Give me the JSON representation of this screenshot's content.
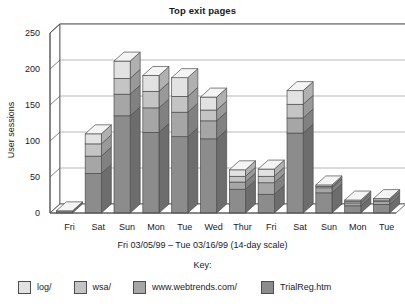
{
  "chart_data": {
    "type": "bar",
    "subtype": "stacked-3d-column",
    "title": "Top exit pages",
    "xlabel": "Fri 03/05/99 – Tue 03/16/99 (14-day scale)",
    "ylabel": "User sessions",
    "categories": [
      "Fri",
      "Sat",
      "Sun",
      "Mon",
      "Tue",
      "Wed",
      "Thur",
      "Fri",
      "Sat",
      "Sun",
      "Mon",
      "Tue"
    ],
    "ylim": [
      0,
      250
    ],
    "yticks": [
      0,
      50,
      100,
      150,
      200,
      250
    ],
    "grid": true,
    "legend_position": "bottom",
    "legend_title": "Key:",
    "series": [
      {
        "name": "TrialReg.htm",
        "color": "#8c8c8c",
        "values": [
          3,
          55,
          135,
          112,
          106,
          103,
          33,
          26,
          111,
          28,
          10,
          12
        ]
      },
      {
        "name": "www.webtrends.com/",
        "color": "#a6a6a6",
        "values": [
          0,
          24,
          30,
          34,
          34,
          25,
          10,
          16,
          21,
          7,
          4,
          4
        ]
      },
      {
        "name": "wsa/",
        "color": "#c4c4c4",
        "values": [
          0,
          17,
          22,
          23,
          22,
          15,
          8,
          9,
          19,
          2,
          2,
          2
        ]
      },
      {
        "name": "log/",
        "color": "#e2e2e2",
        "values": [
          0,
          14,
          24,
          22,
          26,
          18,
          9,
          10,
          19,
          2,
          2,
          2
        ]
      }
    ],
    "totals": [
      3,
      110,
      211,
      191,
      188,
      161,
      60,
      61,
      170,
      39,
      18,
      20
    ]
  },
  "legend": {
    "title": "Key:",
    "items": [
      {
        "label": "log/",
        "color": "#e2e2e2"
      },
      {
        "label": "wsa/",
        "color": "#c4c4c4"
      },
      {
        "label": "www.webtrends.com/",
        "color": "#a6a6a6"
      },
      {
        "label": "TrialReg.htm",
        "color": "#8c8c8c"
      }
    ]
  },
  "axes": {
    "y_title": "User sessions",
    "y_tick_labels": [
      "250",
      "200",
      "150",
      "100",
      "50",
      "0"
    ],
    "x_tick_labels": [
      "Fri",
      "Sat",
      "Sun",
      "Mon",
      "Tue",
      "Wed",
      "Thur",
      "Fri",
      "Sat",
      "Sun",
      "Mon",
      "Tue"
    ],
    "x_title": "Fri 03/05/99 – Tue 03/16/99 (14-day scale)"
  },
  "style": {
    "plot_background": "#ffffff",
    "grid_color": "#9a9a9a",
    "axis_color": "#4d4d4d",
    "outline_color": "#4d4d4d",
    "side_shade": "#767676",
    "text_color": "#1a1a1a"
  }
}
